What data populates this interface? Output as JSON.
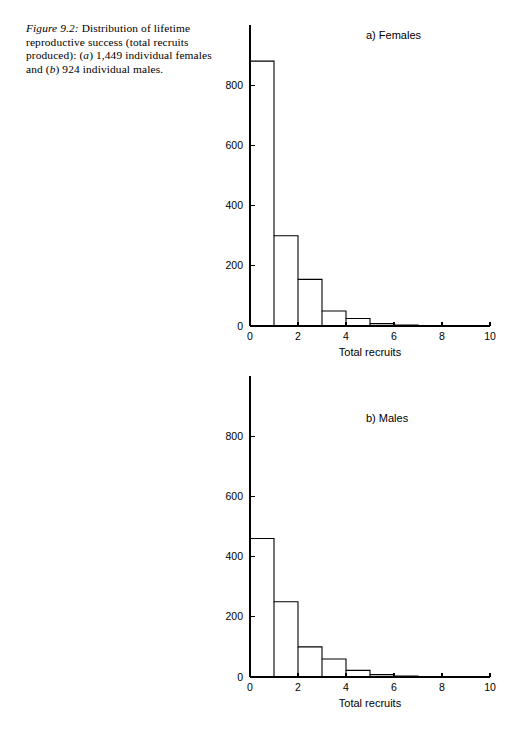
{
  "caption": {
    "figure_label": "Figure 9.2:",
    "line1": " Distribution of lifetime",
    "line2": "reproductive success (total recruits",
    "line3_a": "produced): (",
    "line3_italic": "a",
    "line3_b": ") 1,449 individual",
    "line4_a": "females and (",
    "line4_italic": "b",
    "line4_b": ") 924 individual males."
  },
  "chart_data": [
    {
      "type": "bar",
      "id": "females",
      "title": "a) Females",
      "xlabel": "Total recruits",
      "ylabel": "",
      "xlim": [
        0,
        10
      ],
      "ylim": [
        0,
        1000
      ],
      "grid": false,
      "xticks": [
        0,
        2,
        4,
        6,
        8,
        10
      ],
      "xtick_labels": [
        "0",
        "2",
        "4",
        "6",
        "8",
        "10"
      ],
      "yticks": [
        0,
        200,
        400,
        600,
        800
      ],
      "ytick_labels": [
        "0",
        "200",
        "400",
        "600",
        "800"
      ],
      "bin_edges": [
        0,
        1,
        2,
        3,
        4,
        5,
        6,
        7
      ],
      "categories": [
        "0",
        "1",
        "2",
        "3",
        "4",
        "5",
        "6"
      ],
      "values": [
        880,
        300,
        155,
        50,
        25,
        8,
        3
      ],
      "total_n": 1449
    },
    {
      "type": "bar",
      "id": "males",
      "title": "b) Males",
      "xlabel": "Total recruits",
      "ylabel": "",
      "xlim": [
        0,
        10
      ],
      "ylim": [
        0,
        1000
      ],
      "grid": false,
      "xticks": [
        0,
        2,
        4,
        6,
        8,
        10
      ],
      "xtick_labels": [
        "0",
        "2",
        "4",
        "6",
        "8",
        "10"
      ],
      "yticks": [
        0,
        200,
        400,
        600,
        800
      ],
      "ytick_labels": [
        "0",
        "200",
        "400",
        "600",
        "800"
      ],
      "bin_edges": [
        0,
        1,
        2,
        3,
        4,
        5,
        6,
        7,
        8
      ],
      "categories": [
        "0",
        "1",
        "2",
        "3",
        "4",
        "5",
        "6",
        "7"
      ],
      "values": [
        460,
        250,
        100,
        60,
        22,
        8,
        3,
        1
      ],
      "total_n": 924
    }
  ],
  "colors": {
    "ink": "#000000",
    "background": "#ffffff"
  }
}
